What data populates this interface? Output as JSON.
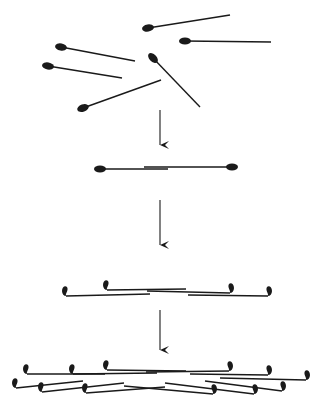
{
  "diagram": {
    "colors": {
      "ink": "#1a1a1a",
      "background": "#ffffff"
    },
    "stages": [
      {
        "name": "monomers",
        "items": [
          {
            "head": [
              148,
              28
            ],
            "tail": [
              230,
              15
            ],
            "angle": -9
          },
          {
            "head": [
              185,
              41
            ],
            "tail": [
              271,
              42
            ],
            "angle": 0
          },
          {
            "head": [
              61,
              47
            ],
            "tail": [
              135,
              61
            ],
            "angle": 10
          },
          {
            "head": [
              48,
              66
            ],
            "tail": [
              122,
              78
            ],
            "angle": 9
          },
          {
            "head": [
              153,
              58
            ],
            "tail": [
              200,
              107
            ],
            "angle": 46
          },
          {
            "head": [
              83,
              108
            ],
            "tail": [
              161,
              80
            ],
            "angle": -20
          }
        ]
      },
      {
        "name": "dimer",
        "items": [
          {
            "head": [
              100,
              169
            ],
            "tail": [
              168,
              169
            ]
          },
          {
            "head": [
              232,
              167
            ],
            "tail": [
              144,
              167
            ]
          }
        ]
      },
      {
        "name": "staggered-assembly",
        "items": [
          {
            "head": [
              66,
              293
            ],
            "tail": [
              150,
              294
            ]
          },
          {
            "head": [
              107,
              287
            ],
            "tail": [
              186,
              289
            ]
          },
          {
            "head": [
              230,
              290
            ],
            "tail": [
              147,
              291
            ]
          },
          {
            "head": [
              268,
              293
            ],
            "tail": [
              188,
              295
            ]
          }
        ]
      },
      {
        "name": "network",
        "items": [
          {
            "head": [
              27,
              371
            ],
            "tail": [
              105,
              374
            ]
          },
          {
            "head": [
              73,
              371
            ],
            "tail": [
              157,
              373
            ]
          },
          {
            "head": [
              107,
              367
            ],
            "tail": [
              186,
              371
            ]
          },
          {
            "head": [
              229,
              368
            ],
            "tail": [
              146,
              372
            ]
          },
          {
            "head": [
              268,
              372
            ],
            "tail": [
              190,
              374
            ]
          },
          {
            "head": [
              306,
              377
            ],
            "tail": [
              220,
              378
            ]
          },
          {
            "head": [
              16,
              385
            ],
            "tail": [
              83,
              381
            ]
          },
          {
            "head": [
              42,
              389
            ],
            "tail": [
              124,
              383
            ]
          },
          {
            "head": [
              86,
              390
            ],
            "tail": [
              165,
              387
            ]
          },
          {
            "head": [
              213,
              391
            ],
            "tail": [
              124,
              386
            ]
          },
          {
            "head": [
              254,
              391
            ],
            "tail": [
              165,
              383
            ]
          },
          {
            "head": [
              282,
              388
            ],
            "tail": [
              205,
              381
            ]
          }
        ]
      }
    ],
    "arrows": [
      {
        "x": 160,
        "y1": 110,
        "y2": 145
      },
      {
        "x": 160,
        "y1": 200,
        "y2": 245
      },
      {
        "x": 160,
        "y1": 310,
        "y2": 350
      }
    ]
  }
}
